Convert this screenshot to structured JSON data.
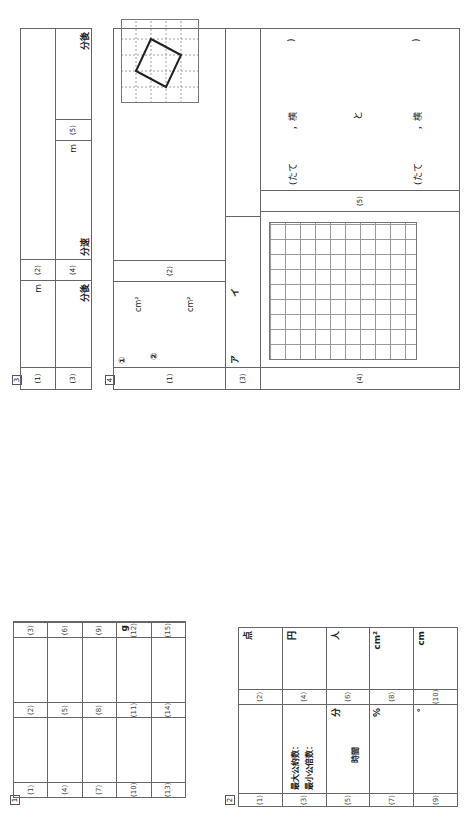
{
  "sections": {
    "s1": {
      "number": "1",
      "rows": [
        [
          {
            "label": "(1)",
            "unit": ""
          },
          {
            "label": "(2)",
            "unit": ""
          },
          {
            "label": "(3)",
            "unit": ""
          }
        ],
        [
          {
            "label": "(4)",
            "unit": ""
          },
          {
            "label": "(5)",
            "unit": ""
          },
          {
            "label": "(6)",
            "unit": ""
          }
        ],
        [
          {
            "label": "(7)",
            "unit": ""
          },
          {
            "label": "(8)",
            "unit": ""
          },
          {
            "label": "(9)",
            "unit": ""
          }
        ],
        [
          {
            "label": "(10)",
            "unit": ""
          },
          {
            "label": "(11)",
            "unit": ""
          },
          {
            "label": "(12)",
            "unit": "g"
          }
        ],
        [
          {
            "label": "(13)",
            "unit": ""
          },
          {
            "label": "(14)",
            "unit": ""
          },
          {
            "label": "(15)",
            "unit": ""
          }
        ]
      ]
    },
    "s2": {
      "number": "2",
      "rows": [
        {
          "left": {
            "label": "(1)"
          },
          "right": {
            "label": "(2)",
            "unit": "点"
          }
        },
        {
          "left": {
            "label": "(3)",
            "line1": "最大公約数：",
            "line2": "最小公倍数："
          },
          "right": {
            "label": "(4)",
            "unit": "円"
          }
        },
        {
          "left": {
            "label": "(5)",
            "mid": "時間",
            "unit": "分"
          },
          "right": {
            "label": "(6)",
            "unit": "人"
          }
        },
        {
          "left": {
            "label": "(7)",
            "unit": "%"
          },
          "right": {
            "label": "(8)",
            "unit": "cm²"
          }
        },
        {
          "left": {
            "label": "(9)",
            "unit": "°"
          },
          "right": {
            "label": "(10)",
            "unit": "cm"
          }
        }
      ]
    },
    "s3": {
      "number": "3",
      "q1_label": "(1)",
      "q1_unit": "m",
      "q2_label": "(2)",
      "q3_label": "(3)",
      "q3_unit": "分後",
      "q4_label": "(4)",
      "q4_unit1": "分速",
      "q4_unit2": "m",
      "q5_label": "(5)",
      "q5_unit": "分後"
    },
    "s4": {
      "number": "4",
      "q1_label": "(1)",
      "q1_sub1": "①",
      "q1_sub2": "②",
      "q1_unit": "cm²",
      "q1_unit2": "cm²",
      "q2_label": "(2)",
      "q3_label": "(3)",
      "q3_a": "ア",
      "q3_b": "イ",
      "q4_label": "(4)",
      "q5_label": "(5)",
      "q5_line1": [
        "(たて",
        "，横",
        ")"
      ],
      "q5_mid": "と",
      "q5_line2": [
        "(たて",
        "，横",
        ")"
      ]
    }
  }
}
